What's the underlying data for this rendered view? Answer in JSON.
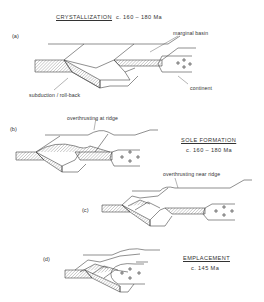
{
  "figure": {
    "stages": [
      {
        "id": "a",
        "panel_label": "(a)",
        "title": "CRYSTALLIZATION",
        "age": "c. 160 – 180 Ma",
        "annotations": [
          "marginal basin",
          "continent",
          "subduction / roll-back"
        ]
      },
      {
        "id": "b",
        "panel_label": "(b)",
        "title": "SOLE  FORMATION",
        "age": "c. 160 – 180 Ma",
        "annotations": [
          "overthrusting at ridge"
        ]
      },
      {
        "id": "c",
        "panel_label": "(c)",
        "annotations": [
          "overthrusting near ridge"
        ]
      },
      {
        "id": "d",
        "panel_label": "(d)",
        "title": "EMPLACEMENT",
        "age": "c. 145 Ma",
        "annotations": []
      }
    ],
    "symbols": {
      "continent_marker": "+",
      "oceanic_crust_fill": "hatched"
    },
    "colors": {
      "line": "#444444",
      "hatch": "#9a9a9a",
      "background": "#ffffff"
    }
  }
}
